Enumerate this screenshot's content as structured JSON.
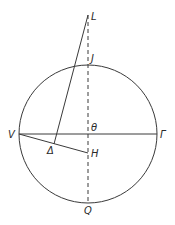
{
  "diagram": {
    "type": "geometric-figure",
    "labels": {
      "L": "L",
      "J": "J",
      "V": "V",
      "Gamma": "Γ",
      "theta": "θ",
      "Delta": "Δ",
      "H": "H",
      "Q": "Q"
    },
    "segments": [
      {
        "from": "V",
        "to": "Γ",
        "style": "solid"
      },
      {
        "from": "L",
        "to": "Q",
        "style": "dashed"
      },
      {
        "from": "L",
        "to": "Δ",
        "style": "solid"
      },
      {
        "from": "V",
        "to": "H",
        "style": "solid"
      }
    ],
    "shapes": [
      {
        "type": "circle",
        "center": "θ",
        "passes_through": [
          "V",
          "Γ",
          "J",
          "Q"
        ]
      }
    ]
  }
}
